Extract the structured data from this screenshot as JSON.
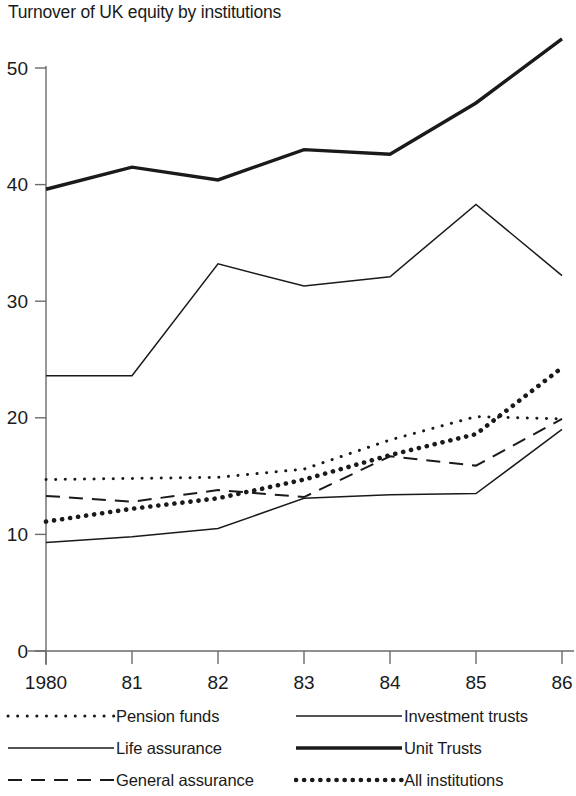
{
  "chart_data": {
    "type": "line",
    "title": "Turnover of UK equity by institutions",
    "xlabel": "",
    "ylabel": "",
    "x": [
      1980,
      1981,
      1982,
      1983,
      1984,
      1985,
      1986
    ],
    "categories": [
      "1980",
      "81",
      "82",
      "83",
      "84",
      "85",
      "86"
    ],
    "xlim": [
      1980,
      1986
    ],
    "ylim": [
      0,
      53
    ],
    "ytick_values": [
      0,
      10,
      20,
      30,
      40,
      50
    ],
    "ytick_labels": [
      "0",
      "10",
      "20",
      "30",
      "40",
      "50"
    ],
    "grid": false,
    "legend_position": "below",
    "series": [
      {
        "name": "Pension funds",
        "style": "fine-dotted",
        "values": [
          14.7,
          14.8,
          14.9,
          15.6,
          18.1,
          20.1,
          19.9
        ]
      },
      {
        "name": "Life assurance",
        "style": "thin-solid",
        "values": [
          9.3,
          9.8,
          10.5,
          13.1,
          13.4,
          13.5,
          19.0
        ]
      },
      {
        "name": "General assurance",
        "style": "dashed",
        "values": [
          13.3,
          12.8,
          13.8,
          13.2,
          16.7,
          15.9,
          19.9
        ]
      },
      {
        "name": "Investment trusts",
        "style": "thin-solid",
        "values": [
          23.6,
          23.6,
          33.2,
          31.3,
          32.1,
          38.3,
          32.2
        ]
      },
      {
        "name": "Unit Trusts",
        "style": "thick-solid",
        "values": [
          39.6,
          41.5,
          40.4,
          43.0,
          42.6,
          47.0,
          52.5
        ]
      },
      {
        "name": "All institutions",
        "style": "bold-dotted",
        "values": [
          11.1,
          12.2,
          13.1,
          14.7,
          16.8,
          18.6,
          24.3
        ]
      }
    ]
  },
  "legend": {
    "left_column": [
      {
        "label": "Pension funds",
        "style": "fine-dotted"
      },
      {
        "label": "Life assurance",
        "style": "thin-solid"
      },
      {
        "label": "General assurance",
        "style": "dashed"
      }
    ],
    "right_column": [
      {
        "label": "Investment trusts",
        "style": "thin-solid"
      },
      {
        "label": "Unit Trusts",
        "style": "thick-solid"
      },
      {
        "label": "All institutions",
        "style": "bold-dotted"
      }
    ]
  },
  "colors": {
    "ink": "#1a1a1a",
    "axis": "#6b6b6b",
    "background": "#ffffff"
  }
}
